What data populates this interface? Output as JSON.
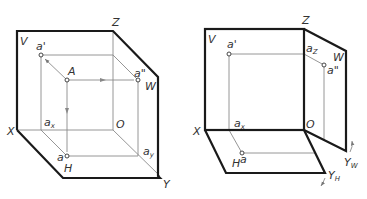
{
  "figure": {
    "left": {
      "description": "Three-plane projection system in axonometric view with point A and its projections",
      "planes": {
        "V": "V",
        "H": "H",
        "W": "W"
      },
      "axes": {
        "X": "X",
        "Y": "Y",
        "Z": "Z",
        "O": "O"
      },
      "points": {
        "A": "A",
        "a_prime": "a'",
        "a_double_prime": "a\"",
        "a_H": "a",
        "a_x": "a",
        "a_x_sub": "x",
        "a_y": "a",
        "a_y_sub": "y"
      }
    },
    "right": {
      "description": "Unfolding of the three projection planes (H rotates down, W rotates right)",
      "planes": {
        "V": "V",
        "H": "H",
        "W": "W"
      },
      "axes": {
        "X": "X",
        "Z": "Z",
        "O": "O",
        "Y_H": "Y",
        "Y_H_sub": "H",
        "Y_W": "Y",
        "Y_W_sub": "W"
      },
      "points": {
        "a_prime": "a'",
        "a_double_prime": "a\"",
        "a_H": "a",
        "a_x": "a",
        "a_x_sub": "x",
        "a_z": "a",
        "a_z_sub": "Z"
      }
    }
  },
  "colors": {
    "thick_line": "#1a1a1a",
    "thin_line": "#8a8a8a",
    "text": "#333333",
    "background": "#ffffff"
  }
}
